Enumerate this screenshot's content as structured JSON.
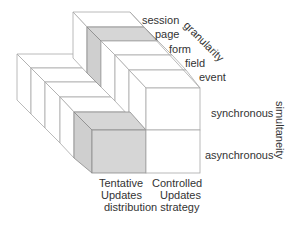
{
  "granularity": {
    "axis_label": "granularity",
    "levels": [
      "session",
      "page",
      "form",
      "field",
      "event"
    ]
  },
  "simultaneity": {
    "axis_label": "simultaneity",
    "levels": [
      "synchronous",
      "asynchronous"
    ]
  },
  "distribution_strategy": {
    "axis_label": "distribution strategy",
    "levels": [
      {
        "line1": "Tentative",
        "line2": "Updates"
      },
      {
        "line1": "Controlled",
        "line2": "Updates"
      }
    ]
  },
  "colors": {
    "highlight": "#d6d6d6",
    "edges": "#a8a8a8"
  }
}
